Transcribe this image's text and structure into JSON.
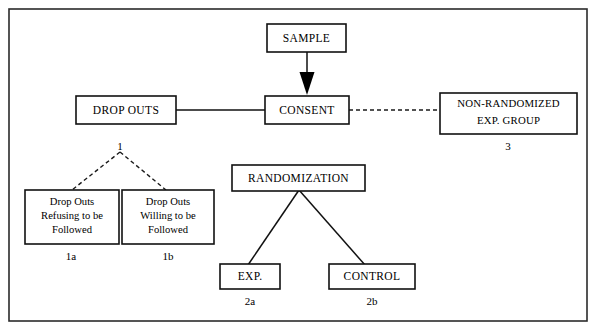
{
  "figure": {
    "background_color": "#ffffff",
    "border_color": "#2b2b2b",
    "line_color": "#111111"
  },
  "nodes": {
    "sample": {
      "label": "SAMPLE"
    },
    "consent": {
      "label": "CONSENT"
    },
    "drop_outs": {
      "label": "DROP OUTS"
    },
    "non_randomized": {
      "line1": "NON-RANDOMIZED",
      "line2": "EXP. GROUP"
    },
    "drop_refusing": {
      "line1": "Drop Outs",
      "line2": "Refusing to be",
      "line3": "Followed"
    },
    "drop_willing": {
      "line1": "Drop Outs",
      "line2": "Willing to be",
      "line3": "Followed"
    },
    "randomization": {
      "label": "RANDOMIZATION"
    },
    "experimental": {
      "label": "EXP."
    },
    "control": {
      "label": "CONTROL"
    }
  },
  "tags": {
    "drop_outs_branch": "1",
    "drop_refusing": "1a",
    "drop_willing": "1b",
    "non_randomized": "3",
    "experimental": "2a",
    "control": "2b"
  }
}
